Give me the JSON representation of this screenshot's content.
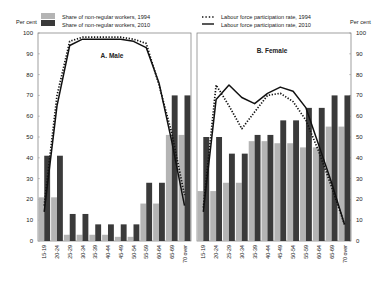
{
  "legend": {
    "bars_1994": "Share of non-regular workers, 1994",
    "bars_2010": "Share of non-regular workers, 2010",
    "line_1994": "Labour force participation rate, 1994",
    "line_2010": "Labour force participation rate, 2010"
  },
  "axis": {
    "left_unit": "Per cent",
    "right_unit": "Per cent",
    "ticks": [
      0,
      10,
      20,
      30,
      40,
      50,
      60,
      70,
      80,
      90,
      100
    ]
  },
  "colors": {
    "bar_1994": "#b4b4b4",
    "bar_2010": "#3a3a3a",
    "line": "#111111",
    "frame": "#777777"
  },
  "chart_data": [
    {
      "type": "bar",
      "title": "A. Male",
      "xlabel": "",
      "ylabel": "Per cent",
      "ylim": [
        0,
        100
      ],
      "categories": [
        "15-19",
        "20-24",
        "25-29",
        "30-34",
        "35-39",
        "40-44",
        "45-49",
        "50-54",
        "55-59",
        "60-64",
        "65-69",
        "70 over"
      ],
      "series": [
        {
          "name": "Share of non-regular workers, 1994",
          "kind": "bar",
          "values": [
            21,
            21,
            3,
            3,
            3,
            3,
            2,
            2,
            18,
            18,
            51,
            51
          ]
        },
        {
          "name": "Share of non-regular workers, 2010",
          "kind": "bar",
          "values": [
            41,
            41,
            13,
            13,
            8,
            8,
            8,
            8,
            28,
            28,
            70,
            70
          ]
        },
        {
          "name": "Labour force participation rate, 1994",
          "kind": "line",
          "style": "dotted",
          "values": [
            17,
            70,
            96,
            98,
            98,
            98,
            98,
            97,
            95,
            75,
            52,
            22
          ]
        },
        {
          "name": "Labour force participation rate, 2010",
          "kind": "line",
          "style": "solid",
          "values": [
            14,
            65,
            94,
            97,
            97,
            97,
            97,
            96,
            93,
            76,
            48,
            17
          ]
        }
      ]
    },
    {
      "type": "bar",
      "title": "B. Female",
      "xlabel": "",
      "ylabel": "Per cent",
      "ylim": [
        0,
        100
      ],
      "categories": [
        "15-19",
        "20-24",
        "25-29",
        "30-34",
        "35-39",
        "40-44",
        "45-49",
        "50-54",
        "55-59",
        "60-64",
        "65-69",
        "70 over"
      ],
      "series": [
        {
          "name": "Share of non-regular workers, 1994",
          "kind": "bar",
          "values": [
            24,
            24,
            28,
            28,
            48,
            48,
            47,
            47,
            45,
            45,
            55,
            55
          ]
        },
        {
          "name": "Share of non-regular workers, 2010",
          "kind": "bar",
          "values": [
            50,
            50,
            42,
            42,
            51,
            51,
            58,
            58,
            64,
            64,
            70,
            70
          ]
        },
        {
          "name": "Labour force participation rate, 1994",
          "kind": "line",
          "style": "dotted",
          "values": [
            16,
            75,
            65,
            54,
            62,
            70,
            71,
            67,
            58,
            43,
            26,
            8
          ]
        },
        {
          "name": "Labour force participation rate, 2010",
          "kind": "line",
          "style": "solid",
          "values": [
            14,
            68,
            75,
            69,
            66,
            71,
            74,
            72,
            64,
            46,
            28,
            8
          ]
        }
      ]
    }
  ]
}
